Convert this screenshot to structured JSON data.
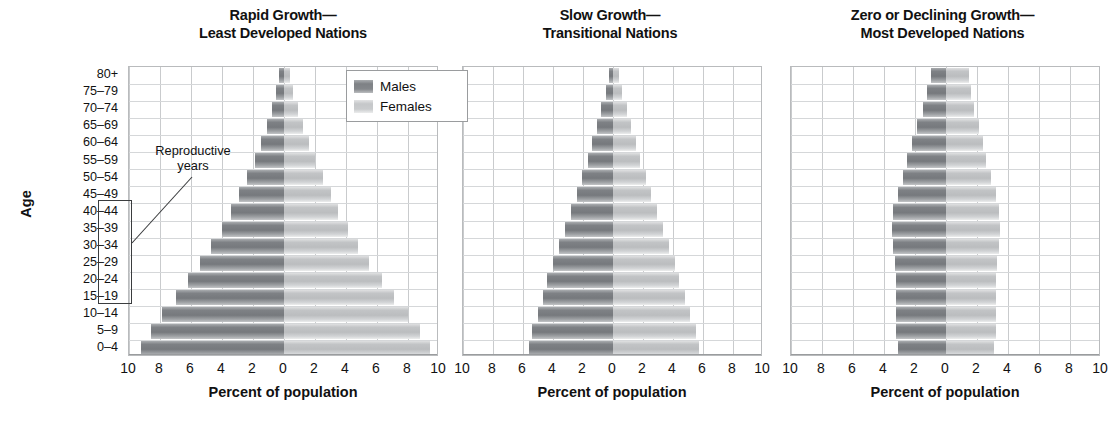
{
  "figure": {
    "y_axis_label": "Age",
    "age_groups": [
      "80+",
      "75–79",
      "70–74",
      "65–69",
      "60–64",
      "55–59",
      "50–54",
      "45–49",
      "40–44",
      "35–39",
      "30–34",
      "25–29",
      "20–24",
      "15–19",
      "10–14",
      "5–9",
      "0–4"
    ],
    "x_tick_labels": [
      "10",
      "8",
      "6",
      "4",
      "2",
      "0",
      "2",
      "4",
      "6",
      "8",
      "10"
    ],
    "x_axis_title": "Percent of population",
    "x_range": [
      -10,
      10
    ],
    "legend": {
      "males_label": "Males",
      "females_label": "Females"
    },
    "annotation": {
      "line1": "Reproductive",
      "line2": "years",
      "covers_age_groups": [
        "15–19",
        "20–24",
        "25–29",
        "30–34",
        "35–39",
        "40–44",
        "45–49"
      ]
    },
    "colors": {
      "male": "#7e8185",
      "female": "#c5c7c9",
      "grid": "#c9cbcd",
      "frame": "#b9bbbd",
      "text": "#111111"
    }
  },
  "chart_data": [
    {
      "type": "bar",
      "orientation": "population-pyramid",
      "title": "Rapid Growth—Least Developed Nations",
      "title_line1": "Rapid Growth—",
      "title_line2": "Least Developed Nations",
      "xlabel": "Percent of population",
      "ylabel": "Age",
      "xlim": [
        -10,
        10
      ],
      "xticks": [
        -10,
        -8,
        -6,
        -4,
        -2,
        0,
        2,
        4,
        6,
        8,
        10
      ],
      "xticklabels": [
        "10",
        "8",
        "6",
        "4",
        "2",
        "0",
        "2",
        "4",
        "6",
        "8",
        "10"
      ],
      "grid": true,
      "legend_position": "top-right",
      "categories": [
        "80+",
        "75–79",
        "70–74",
        "65–69",
        "60–64",
        "55–59",
        "50–54",
        "45–49",
        "40–44",
        "35–39",
        "30–34",
        "25–29",
        "20–24",
        "15–19",
        "10–14",
        "5–9",
        "0–4"
      ],
      "series": [
        {
          "name": "Males",
          "values": [
            0.3,
            0.5,
            0.8,
            1.1,
            1.5,
            1.9,
            2.4,
            2.9,
            3.4,
            4.0,
            4.7,
            5.4,
            6.2,
            7.0,
            7.9,
            8.6,
            9.2
          ]
        },
        {
          "name": "Females",
          "values": [
            0.4,
            0.6,
            0.9,
            1.2,
            1.6,
            2.0,
            2.5,
            3.0,
            3.5,
            4.1,
            4.8,
            5.5,
            6.3,
            7.1,
            8.0,
            8.8,
            9.4
          ]
        }
      ]
    },
    {
      "type": "bar",
      "orientation": "population-pyramid",
      "title": "Slow Growth—Transitional Nations",
      "title_line1": "Slow Growth—",
      "title_line2": "Transitional Nations",
      "xlabel": "Percent of population",
      "ylabel": "Age",
      "xlim": [
        -10,
        10
      ],
      "xticks": [
        -10,
        -8,
        -6,
        -4,
        -2,
        0,
        2,
        4,
        6,
        8,
        10
      ],
      "xticklabels": [
        "10",
        "8",
        "6",
        "4",
        "2",
        "0",
        "2",
        "4",
        "6",
        "8",
        "10"
      ],
      "grid": true,
      "legend_position": "none",
      "categories": [
        "80+",
        "75–79",
        "70–74",
        "65–69",
        "60–64",
        "55–59",
        "50–54",
        "45–49",
        "40–44",
        "35–39",
        "30–34",
        "25–29",
        "20–24",
        "15–19",
        "10–14",
        "5–9",
        "0–4"
      ],
      "series": [
        {
          "name": "Males",
          "values": [
            0.3,
            0.5,
            0.8,
            1.1,
            1.4,
            1.7,
            2.1,
            2.4,
            2.8,
            3.2,
            3.6,
            4.0,
            4.4,
            4.7,
            5.0,
            5.4,
            5.6
          ]
        },
        {
          "name": "Females",
          "values": [
            0.4,
            0.6,
            0.9,
            1.2,
            1.5,
            1.8,
            2.2,
            2.5,
            2.9,
            3.3,
            3.7,
            4.1,
            4.4,
            4.8,
            5.1,
            5.5,
            5.7
          ]
        }
      ]
    },
    {
      "type": "bar",
      "orientation": "population-pyramid",
      "title": "Zero or Declining Growth—Most Developed Nations",
      "title_line1": "Zero or Declining Growth—",
      "title_line2": "Most Developed Nations",
      "xlabel": "Percent of population",
      "ylabel": "Age",
      "xlim": [
        -10,
        10
      ],
      "xticks": [
        -10,
        -8,
        -6,
        -4,
        -2,
        0,
        2,
        4,
        6,
        8,
        10
      ],
      "xticklabels": [
        "10",
        "8",
        "6",
        "4",
        "2",
        "0",
        "2",
        "4",
        "6",
        "8",
        "10"
      ],
      "grid": true,
      "legend_position": "none",
      "categories": [
        "80+",
        "75–79",
        "70–74",
        "65–69",
        "60–64",
        "55–59",
        "50–54",
        "45–49",
        "40–44",
        "35–39",
        "30–34",
        "25–29",
        "20–24",
        "15–19",
        "10–14",
        "5–9",
        "0–4"
      ],
      "series": [
        {
          "name": "Males",
          "values": [
            1.0,
            1.2,
            1.5,
            1.9,
            2.2,
            2.5,
            2.8,
            3.1,
            3.4,
            3.5,
            3.4,
            3.3,
            3.2,
            3.2,
            3.2,
            3.2,
            3.1
          ]
        },
        {
          "name": "Females",
          "values": [
            1.5,
            1.6,
            1.8,
            2.1,
            2.4,
            2.6,
            2.9,
            3.2,
            3.4,
            3.5,
            3.4,
            3.3,
            3.2,
            3.2,
            3.2,
            3.2,
            3.1
          ]
        }
      ]
    }
  ]
}
